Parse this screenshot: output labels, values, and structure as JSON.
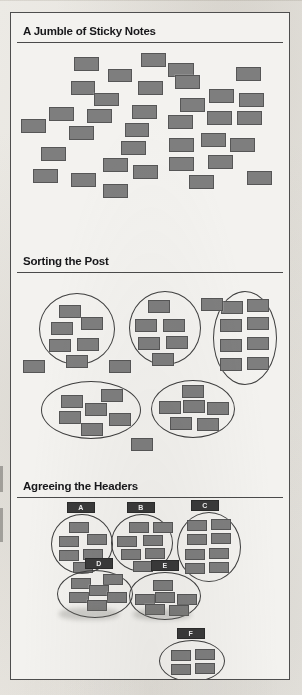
{
  "figure": {
    "background_color": "#f3f2ef",
    "note_color": "#7e7e7e",
    "note_border_color": "#565656",
    "ink_color": "#17171a",
    "tag_color": "#3a3a3a"
  },
  "panels": [
    {
      "id": "panel-jumble",
      "title": "A Jumble of Sticky Notes",
      "top": 2,
      "height": 228,
      "title_y": 10,
      "rule_y": 27
    },
    {
      "id": "panel-sorting",
      "title": "Sorting the Post",
      "top": 230,
      "height": 225,
      "title_y": 12,
      "rule_y": 29
    },
    {
      "id": "panel-headers",
      "title": "Agreeing the Headers",
      "top": 455,
      "height": 213,
      "title_y": 12,
      "rule_y": 29
    }
  ],
  "chart_data": {
    "type": "diagram",
    "panel_titles": [
      "A Jumble of Sticky Notes",
      "Sorting the Post",
      "Agreeing the Headers"
    ],
    "stages": [
      {
        "name": "A Jumble of Sticky Notes",
        "note_count": 33,
        "group_count": 0,
        "labels": []
      },
      {
        "name": "Sorting the Post",
        "note_count": 39,
        "group_count": 5,
        "labels": []
      },
      {
        "name": "Agreeing the Headers",
        "note_count": 37,
        "group_count": 6,
        "labels": [
          "A",
          "B",
          "C",
          "D",
          "E",
          "F"
        ]
      }
    ],
    "group_labels": [
      "A",
      "B",
      "C",
      "D",
      "E",
      "F"
    ],
    "group_note_counts": {
      "A": 6,
      "B": 7,
      "C": 8,
      "D": 6,
      "E": 6,
      "F": 4
    }
  },
  "panel1_notes": [
    {
      "x": 63,
      "y": 12,
      "w": 25,
      "h": 14
    },
    {
      "x": 97,
      "y": 24,
      "w": 24,
      "h": 13
    },
    {
      "x": 60,
      "y": 36,
      "w": 24,
      "h": 14
    },
    {
      "x": 83,
      "y": 48,
      "w": 25,
      "h": 13
    },
    {
      "x": 130,
      "y": 8,
      "w": 25,
      "h": 14
    },
    {
      "x": 127,
      "y": 36,
      "w": 25,
      "h": 14
    },
    {
      "x": 157,
      "y": 18,
      "w": 26,
      "h": 14
    },
    {
      "x": 164,
      "y": 30,
      "w": 25,
      "h": 14
    },
    {
      "x": 225,
      "y": 22,
      "w": 25,
      "h": 14
    },
    {
      "x": 198,
      "y": 44,
      "w": 25,
      "h": 14
    },
    {
      "x": 228,
      "y": 48,
      "w": 25,
      "h": 14
    },
    {
      "x": 169,
      "y": 53,
      "w": 25,
      "h": 14
    },
    {
      "x": 38,
      "y": 62,
      "w": 25,
      "h": 14
    },
    {
      "x": 76,
      "y": 64,
      "w": 25,
      "h": 14
    },
    {
      "x": 121,
      "y": 60,
      "w": 25,
      "h": 14
    },
    {
      "x": 10,
      "y": 74,
      "w": 25,
      "h": 14
    },
    {
      "x": 58,
      "y": 81,
      "w": 25,
      "h": 14
    },
    {
      "x": 114,
      "y": 78,
      "w": 24,
      "h": 14
    },
    {
      "x": 157,
      "y": 70,
      "w": 25,
      "h": 14
    },
    {
      "x": 196,
      "y": 66,
      "w": 25,
      "h": 14
    },
    {
      "x": 226,
      "y": 66,
      "w": 25,
      "h": 14
    },
    {
      "x": 190,
      "y": 88,
      "w": 25,
      "h": 14
    },
    {
      "x": 30,
      "y": 102,
      "w": 25,
      "h": 14
    },
    {
      "x": 110,
      "y": 96,
      "w": 25,
      "h": 14
    },
    {
      "x": 158,
      "y": 93,
      "w": 25,
      "h": 14
    },
    {
      "x": 219,
      "y": 93,
      "w": 25,
      "h": 14
    },
    {
      "x": 92,
      "y": 113,
      "w": 25,
      "h": 14
    },
    {
      "x": 158,
      "y": 112,
      "w": 25,
      "h": 14
    },
    {
      "x": 197,
      "y": 110,
      "w": 25,
      "h": 14
    },
    {
      "x": 22,
      "y": 124,
      "w": 25,
      "h": 14
    },
    {
      "x": 60,
      "y": 128,
      "w": 25,
      "h": 14
    },
    {
      "x": 122,
      "y": 120,
      "w": 25,
      "h": 14
    },
    {
      "x": 92,
      "y": 139,
      "w": 25,
      "h": 14
    },
    {
      "x": 178,
      "y": 130,
      "w": 25,
      "h": 14
    },
    {
      "x": 236,
      "y": 126,
      "w": 25,
      "h": 14
    }
  ],
  "panel2_groups": [
    {
      "name": "group-1",
      "ellipse": {
        "x": 28,
        "y": 50,
        "w": 76,
        "h": 72
      },
      "notes": [
        {
          "x": 48,
          "y": 62,
          "w": 22,
          "h": 13
        },
        {
          "x": 40,
          "y": 79,
          "w": 22,
          "h": 13
        },
        {
          "x": 70,
          "y": 74,
          "w": 22,
          "h": 13
        },
        {
          "x": 38,
          "y": 96,
          "w": 22,
          "h": 13
        },
        {
          "x": 66,
          "y": 95,
          "w": 22,
          "h": 13
        },
        {
          "x": 55,
          "y": 112,
          "w": 22,
          "h": 13
        }
      ]
    },
    {
      "name": "group-2",
      "ellipse": {
        "x": 118,
        "y": 48,
        "w": 72,
        "h": 74
      },
      "notes": [
        {
          "x": 137,
          "y": 57,
          "w": 22,
          "h": 13
        },
        {
          "x": 124,
          "y": 76,
          "w": 22,
          "h": 13
        },
        {
          "x": 152,
          "y": 76,
          "w": 22,
          "h": 13
        },
        {
          "x": 127,
          "y": 94,
          "w": 22,
          "h": 13
        },
        {
          "x": 155,
          "y": 93,
          "w": 22,
          "h": 13
        },
        {
          "x": 141,
          "y": 110,
          "w": 22,
          "h": 13
        }
      ]
    },
    {
      "name": "group-3",
      "ellipse": {
        "x": 202,
        "y": 48,
        "w": 64,
        "h": 94
      },
      "notes": [
        {
          "x": 210,
          "y": 58,
          "w": 22,
          "h": 13
        },
        {
          "x": 236,
          "y": 56,
          "w": 22,
          "h": 13
        },
        {
          "x": 209,
          "y": 76,
          "w": 22,
          "h": 13
        },
        {
          "x": 236,
          "y": 74,
          "w": 22,
          "h": 13
        },
        {
          "x": 209,
          "y": 96,
          "w": 22,
          "h": 13
        },
        {
          "x": 236,
          "y": 94,
          "w": 22,
          "h": 13
        },
        {
          "x": 209,
          "y": 115,
          "w": 22,
          "h": 13
        },
        {
          "x": 236,
          "y": 114,
          "w": 22,
          "h": 13
        }
      ]
    },
    {
      "name": "group-4",
      "ellipse": {
        "x": 30,
        "y": 138,
        "w": 100,
        "h": 58
      },
      "notes": [
        {
          "x": 50,
          "y": 152,
          "w": 22,
          "h": 13
        },
        {
          "x": 90,
          "y": 146,
          "w": 22,
          "h": 13
        },
        {
          "x": 48,
          "y": 168,
          "w": 22,
          "h": 13
        },
        {
          "x": 74,
          "y": 160,
          "w": 22,
          "h": 13
        },
        {
          "x": 98,
          "y": 170,
          "w": 22,
          "h": 13
        },
        {
          "x": 70,
          "y": 180,
          "w": 22,
          "h": 13
        }
      ]
    },
    {
      "name": "group-5",
      "ellipse": {
        "x": 140,
        "y": 137,
        "w": 84,
        "h": 58
      },
      "notes": [
        {
          "x": 171,
          "y": 142,
          "w": 22,
          "h": 13
        },
        {
          "x": 148,
          "y": 158,
          "w": 22,
          "h": 13
        },
        {
          "x": 172,
          "y": 157,
          "w": 22,
          "h": 13
        },
        {
          "x": 196,
          "y": 159,
          "w": 22,
          "h": 13
        },
        {
          "x": 159,
          "y": 174,
          "w": 22,
          "h": 13
        },
        {
          "x": 186,
          "y": 175,
          "w": 22,
          "h": 13
        }
      ]
    }
  ],
  "panel2_loose_notes": [
    {
      "x": 190,
      "y": 55,
      "w": 22,
      "h": 13
    },
    {
      "x": 12,
      "y": 117,
      "w": 22,
      "h": 13
    },
    {
      "x": 98,
      "y": 117,
      "w": 22,
      "h": 13
    },
    {
      "x": 120,
      "y": 195,
      "w": 22,
      "h": 13
    }
  ],
  "panel3_groups": [
    {
      "label": "A",
      "tag": {
        "x": 56,
        "y": 2,
        "w": 28,
        "h": 11
      },
      "ellipse": {
        "x": 40,
        "y": 14,
        "w": 62,
        "h": 60
      },
      "notes": [
        {
          "x": 58,
          "y": 22,
          "w": 20,
          "h": 11
        },
        {
          "x": 48,
          "y": 36,
          "w": 20,
          "h": 11
        },
        {
          "x": 76,
          "y": 34,
          "w": 20,
          "h": 11
        },
        {
          "x": 48,
          "y": 50,
          "w": 20,
          "h": 11
        },
        {
          "x": 72,
          "y": 49,
          "w": 20,
          "h": 11
        },
        {
          "x": 62,
          "y": 62,
          "w": 20,
          "h": 11
        }
      ]
    },
    {
      "label": "B",
      "tag": {
        "x": 116,
        "y": 2,
        "w": 28,
        "h": 11
      },
      "ellipse": {
        "x": 100,
        "y": 14,
        "w": 62,
        "h": 58
      },
      "notes": [
        {
          "x": 118,
          "y": 22,
          "w": 20,
          "h": 11
        },
        {
          "x": 106,
          "y": 36,
          "w": 20,
          "h": 11
        },
        {
          "x": 132,
          "y": 35,
          "w": 20,
          "h": 11
        },
        {
          "x": 110,
          "y": 49,
          "w": 20,
          "h": 11
        },
        {
          "x": 134,
          "y": 48,
          "w": 20,
          "h": 11
        },
        {
          "x": 122,
          "y": 61,
          "w": 20,
          "h": 11
        },
        {
          "x": 142,
          "y": 22,
          "w": 20,
          "h": 11
        }
      ]
    },
    {
      "label": "C",
      "tag": {
        "x": 180,
        "y": 0,
        "w": 28,
        "h": 11
      },
      "ellipse": {
        "x": 166,
        "y": 12,
        "w": 64,
        "h": 70
      },
      "notes": [
        {
          "x": 176,
          "y": 20,
          "w": 20,
          "h": 11
        },
        {
          "x": 200,
          "y": 19,
          "w": 20,
          "h": 11
        },
        {
          "x": 176,
          "y": 34,
          "w": 20,
          "h": 11
        },
        {
          "x": 200,
          "y": 33,
          "w": 20,
          "h": 11
        },
        {
          "x": 174,
          "y": 49,
          "w": 20,
          "h": 11
        },
        {
          "x": 198,
          "y": 48,
          "w": 20,
          "h": 11
        },
        {
          "x": 174,
          "y": 63,
          "w": 20,
          "h": 11
        },
        {
          "x": 198,
          "y": 62,
          "w": 20,
          "h": 11
        }
      ]
    },
    {
      "label": "D",
      "tag": {
        "x": 74,
        "y": 58,
        "w": 28,
        "h": 11
      },
      "ellipse": {
        "x": 46,
        "y": 70,
        "w": 76,
        "h": 48
      },
      "notes": [
        {
          "x": 60,
          "y": 78,
          "w": 20,
          "h": 11
        },
        {
          "x": 92,
          "y": 74,
          "w": 20,
          "h": 11
        },
        {
          "x": 58,
          "y": 92,
          "w": 20,
          "h": 11
        },
        {
          "x": 78,
          "y": 85,
          "w": 20,
          "h": 11
        },
        {
          "x": 96,
          "y": 92,
          "w": 20,
          "h": 11
        },
        {
          "x": 76,
          "y": 100,
          "w": 20,
          "h": 11
        }
      ]
    },
    {
      "label": "E",
      "tag": {
        "x": 140,
        "y": 60,
        "w": 28,
        "h": 11
      },
      "ellipse": {
        "x": 118,
        "y": 72,
        "w": 72,
        "h": 48
      },
      "notes": [
        {
          "x": 142,
          "y": 80,
          "w": 20,
          "h": 11
        },
        {
          "x": 124,
          "y": 94,
          "w": 20,
          "h": 11
        },
        {
          "x": 144,
          "y": 92,
          "w": 20,
          "h": 11
        },
        {
          "x": 166,
          "y": 94,
          "w": 20,
          "h": 11
        },
        {
          "x": 134,
          "y": 104,
          "w": 20,
          "h": 11
        },
        {
          "x": 158,
          "y": 105,
          "w": 20,
          "h": 11
        }
      ]
    },
    {
      "label": "F",
      "tag": {
        "x": 166,
        "y": 128,
        "w": 28,
        "h": 11
      },
      "ellipse": {
        "x": 148,
        "y": 140,
        "w": 66,
        "h": 42
      },
      "notes": [
        {
          "x": 160,
          "y": 150,
          "w": 20,
          "h": 11
        },
        {
          "x": 184,
          "y": 149,
          "w": 20,
          "h": 11
        },
        {
          "x": 160,
          "y": 164,
          "w": 20,
          "h": 11
        },
        {
          "x": 184,
          "y": 163,
          "w": 20,
          "h": 11
        }
      ]
    }
  ]
}
